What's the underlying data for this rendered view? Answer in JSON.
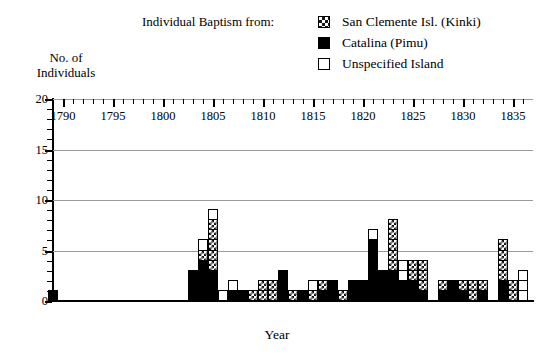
{
  "legend": {
    "title": "Individual Baptism from:",
    "entries": [
      {
        "label": "San Clemente Isl. (Kinki)",
        "swatch": "checker-swatch-icon",
        "color": "#1a1a1a"
      },
      {
        "label": "Catalina (Pimu)",
        "swatch": "solid-swatch-icon",
        "color": "#000000"
      },
      {
        "label": "Unspecified Island",
        "swatch": "open-swatch-icon",
        "color": "#ffffff"
      }
    ]
  },
  "axes": {
    "ylabel_line1": "No. of",
    "ylabel_line2": "Individuals",
    "xlabel": "Year",
    "yticks": [
      "0",
      "5",
      "10",
      "15",
      "20"
    ],
    "xticks": [
      "1790",
      "1795",
      "1800",
      "1805",
      "1810",
      "1815",
      "1820",
      "1825",
      "1830",
      "1835"
    ]
  },
  "chart_data": {
    "type": "bar",
    "title": "",
    "subtitle": "",
    "xlabel": "Year",
    "ylabel": "No. of Individuals",
    "xlim": [
      1789,
      1837
    ],
    "ylim": [
      0,
      20
    ],
    "grid": true,
    "gridlines_y": [
      5,
      10,
      15,
      20
    ],
    "stacked": true,
    "legend_position": "top-right",
    "legend_title": "Individual Baptism from:",
    "series": [
      {
        "name": "San Clemente Isl. (Kinki)",
        "style": "checker",
        "values": [
          0,
          0,
          0,
          0,
          0,
          0,
          0,
          0,
          0,
          0,
          0,
          0,
          0,
          0,
          0,
          1,
          5,
          0,
          0,
          0,
          1,
          2,
          2,
          0,
          1,
          0,
          1,
          1,
          0,
          1,
          0,
          0,
          0,
          0,
          5,
          0,
          2,
          3,
          0,
          1,
          0,
          1,
          2,
          1,
          0,
          4,
          2,
          0
        ]
      },
      {
        "name": "Catalina (Pimu)",
        "style": "solid",
        "values": [
          1,
          0,
          0,
          0,
          0,
          0,
          0,
          0,
          0,
          0,
          0,
          0,
          0,
          0,
          3,
          4,
          3,
          0,
          1,
          1,
          0,
          0,
          0,
          3,
          0,
          1,
          0,
          1,
          2,
          0,
          2,
          2,
          6,
          3,
          3,
          2,
          2,
          1,
          0,
          1,
          2,
          1,
          0,
          1,
          0,
          2,
          0,
          0
        ]
      },
      {
        "name": "Unspecified Island",
        "style": "open",
        "values": [
          0,
          0,
          0,
          0,
          0,
          0,
          0,
          0,
          0,
          0,
          0,
          0,
          0,
          0,
          0,
          1,
          1,
          1,
          1,
          0,
          0,
          0,
          0,
          0,
          0,
          0,
          1,
          0,
          0,
          0,
          0,
          0,
          1,
          0,
          0,
          2,
          0,
          0,
          0,
          0,
          0,
          0,
          0,
          0,
          0,
          0,
          0,
          3
        ]
      }
    ],
    "x": [
      1789,
      1790,
      1791,
      1792,
      1793,
      1794,
      1795,
      1796,
      1797,
      1798,
      1799,
      1800,
      1801,
      1802,
      1803,
      1804,
      1805,
      1806,
      1807,
      1808,
      1809,
      1810,
      1811,
      1812,
      1813,
      1814,
      1815,
      1816,
      1817,
      1818,
      1819,
      1820,
      1821,
      1822,
      1823,
      1824,
      1825,
      1826,
      1827,
      1828,
      1829,
      1830,
      1831,
      1832,
      1833,
      1834,
      1835,
      1836
    ],
    "totals": [
      1,
      0,
      0,
      0,
      0,
      0,
      0,
      0,
      0,
      0,
      0,
      0,
      0,
      0,
      3,
      6,
      9,
      1,
      2,
      1,
      1,
      2,
      2,
      3,
      1,
      1,
      2,
      2,
      2,
      1,
      2,
      2,
      7,
      6,
      8,
      4,
      4,
      4,
      0,
      2,
      2,
      2,
      2,
      2,
      0,
      6,
      2,
      3
    ]
  }
}
